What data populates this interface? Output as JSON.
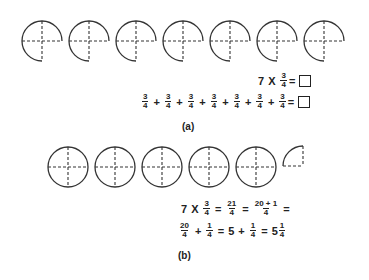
{
  "part_a": {
    "label": "(a)",
    "figure_count": 7,
    "figure_shape": "three-quarter circle divided into quarters",
    "equation1": {
      "multiplier": "7",
      "times": "X",
      "num": "3",
      "den": "4",
      "equals": "=",
      "answer_box": "empty"
    },
    "equation2": {
      "terms": [
        {
          "num": "3",
          "den": "4"
        },
        {
          "num": "3",
          "den": "4"
        },
        {
          "num": "3",
          "den": "4"
        },
        {
          "num": "3",
          "den": "4"
        },
        {
          "num": "3",
          "den": "4"
        },
        {
          "num": "3",
          "den": "4"
        },
        {
          "num": "3",
          "den": "4"
        }
      ],
      "plus": "+",
      "equals": "=",
      "answer_box": "empty"
    }
  },
  "part_b": {
    "label": "(b)",
    "whole_circles": 5,
    "extra_quarter": 1,
    "line1": {
      "multiplier": "7",
      "times": "X",
      "f1": {
        "num": "3",
        "den": "4"
      },
      "eq": "=",
      "f2": {
        "num": "21",
        "den": "4"
      },
      "f3": {
        "num": "20 + 1",
        "den": "4"
      }
    },
    "line2": {
      "f1": {
        "num": "20",
        "den": "4"
      },
      "plus": "+",
      "f2": {
        "num": "1",
        "den": "4"
      },
      "eq": "=",
      "whole": "5",
      "f3": {
        "num": "1",
        "den": "4"
      },
      "mixed_whole": "5",
      "mixed_frac": {
        "num": "1",
        "den": "4"
      }
    }
  }
}
